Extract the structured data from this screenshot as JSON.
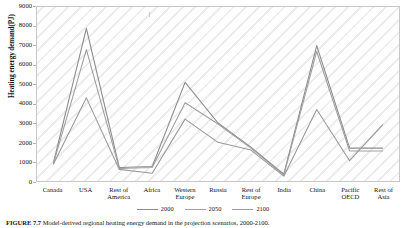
{
  "figure": {
    "caption_label": "FIGURE 7.7",
    "caption_text": "Model-derived regional heating energy demand in the projection scenarios, 2000-2100."
  },
  "chart_data": {
    "type": "line",
    "title": "",
    "xlabel": "",
    "ylabel": "Heating energy demand(PJ)",
    "ylim": [
      0,
      9000
    ],
    "ytick_step": 1000,
    "yticks": [
      "9000",
      "8000",
      "7000",
      "6000",
      "5000",
      "4000",
      "3000",
      "2000",
      "1000",
      "0"
    ],
    "grid": false,
    "legend_position": "bottom",
    "categories": [
      "Canada",
      "USA",
      "Rest of America",
      "Africa",
      "Western Europe",
      "Russia",
      "Rest of Europe",
      "India",
      "China",
      "Pacific OECD",
      "Rest of Asia"
    ],
    "category_lines": [
      [
        "Canada"
      ],
      [
        "USA"
      ],
      [
        "Rest of",
        "America"
      ],
      [
        "Africa"
      ],
      [
        "Western",
        "Europe"
      ],
      [
        "Russia"
      ],
      [
        "Rest of",
        "Europe"
      ],
      [
        "India"
      ],
      [
        "China"
      ],
      [
        "Pacific",
        "OECD"
      ],
      [
        "Rest of",
        "Asia"
      ]
    ],
    "series": [
      {
        "name": "2000",
        "color": "#8c8c8c",
        "values": [
          950,
          7900,
          700,
          750,
          5100,
          3000,
          1750,
          350,
          7000,
          1700,
          1700
        ]
      },
      {
        "name": "2050",
        "color": "#a0a0a0",
        "values": [
          900,
          6800,
          650,
          700,
          4050,
          2950,
          1700,
          300,
          6700,
          1550,
          1550
        ]
      },
      {
        "name": "2100",
        "color": "#9a9a9a",
        "values": [
          880,
          4300,
          600,
          400,
          3200,
          2000,
          1600,
          250,
          3700,
          1050,
          2900
        ]
      }
    ]
  }
}
